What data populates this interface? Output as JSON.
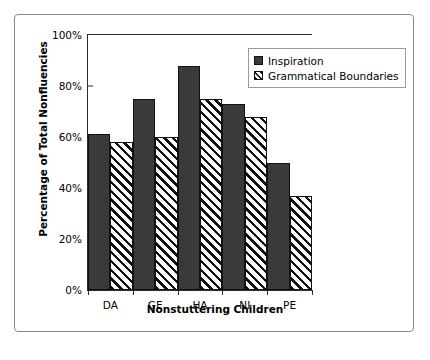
{
  "chart_data": {
    "type": "bar",
    "title": "",
    "subtitle": "",
    "xlabel": "Nonstuttering Children",
    "ylabel": "Percentage of Total Nonfluencies",
    "categories": [
      "DA",
      "GE",
      "HA",
      "NI",
      "PE"
    ],
    "series": [
      {
        "name": "Inspiration",
        "fill": "solid",
        "color": "#3a3a3a",
        "values": [
          61,
          75,
          88,
          73,
          50
        ]
      },
      {
        "name": "Grammatical Boundaries",
        "fill": "diagonal-hatch",
        "color": "#ffffff",
        "values": [
          58,
          60,
          75,
          68,
          37
        ]
      }
    ],
    "ylim": [
      0,
      100
    ],
    "ytick_values": [
      0,
      20,
      40,
      60,
      80,
      100
    ],
    "ytick_labels": [
      "0%",
      "20%",
      "40%",
      "60%",
      "80%",
      "100%"
    ],
    "grid": false,
    "legend_position": "upper-right-inside"
  }
}
